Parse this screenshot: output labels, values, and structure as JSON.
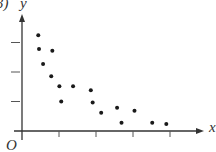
{
  "labels": {
    "corner": "3)",
    "y_axis": "y",
    "x_axis": "x",
    "origin": "O"
  },
  "colors": {
    "axis": "#333333",
    "point": "#1a1a1a"
  },
  "chart_data": {
    "type": "scatter",
    "title": "",
    "xlabel": "x",
    "ylabel": "y",
    "origin_label": "O",
    "grid": false,
    "legend": null,
    "x_ticks": 4,
    "y_ticks": 3,
    "xlim": [
      0,
      5
    ],
    "ylim": [
      0,
      4
    ],
    "points": [
      {
        "x": 0.44,
        "y": 3.25
      },
      {
        "x": 0.46,
        "y": 2.78
      },
      {
        "x": 0.82,
        "y": 2.72
      },
      {
        "x": 0.57,
        "y": 2.27
      },
      {
        "x": 0.79,
        "y": 1.86
      },
      {
        "x": 1.01,
        "y": 1.52
      },
      {
        "x": 1.38,
        "y": 1.52
      },
      {
        "x": 1.06,
        "y": 1.0
      },
      {
        "x": 1.86,
        "y": 1.38
      },
      {
        "x": 1.91,
        "y": 0.97
      },
      {
        "x": 2.14,
        "y": 0.62
      },
      {
        "x": 2.57,
        "y": 0.79
      },
      {
        "x": 2.69,
        "y": 0.28
      },
      {
        "x": 3.04,
        "y": 0.69
      },
      {
        "x": 3.52,
        "y": 0.28
      },
      {
        "x": 3.9,
        "y": 0.24
      }
    ]
  }
}
